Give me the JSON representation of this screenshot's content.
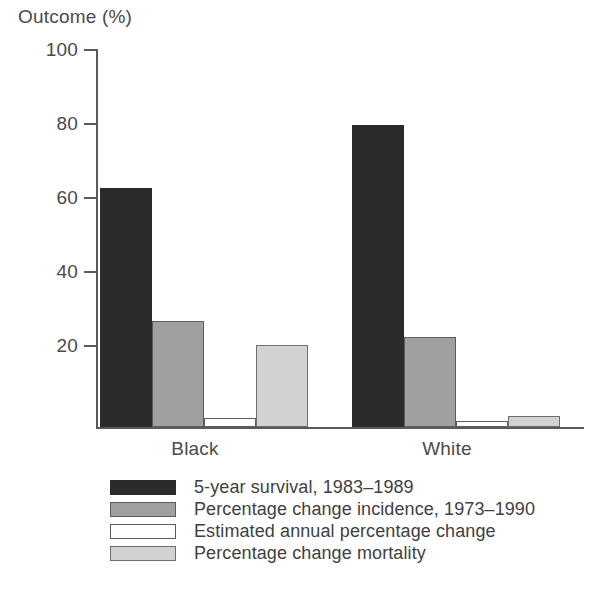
{
  "chart_data": {
    "type": "bar",
    "title": "",
    "xlabel": "",
    "ylabel": "Outcome (%)",
    "ylim": [
      0,
      100
    ],
    "yticks": [
      0,
      20,
      40,
      60,
      80,
      100
    ],
    "ytick_labels": [
      "",
      "20",
      "40",
      "60",
      "80",
      "100"
    ],
    "grid": false,
    "legend_position": "bottom-left",
    "categories": [
      "Black",
      "White"
    ],
    "series": [
      {
        "name": "5-year survival, 1983–1989",
        "color": "#2b2b2b",
        "values": [
          63.5,
          80.0
        ]
      },
      {
        "name": "Percentage change incidence, 1973–1990",
        "color": "#a0a0a0",
        "values": [
          28.0,
          23.8
        ]
      },
      {
        "name": "Estimated annual percentage change",
        "color": "#ffffff",
        "values": [
          2.5,
          1.5
        ]
      },
      {
        "name": "Percentage change mortality",
        "color": "#d2d2d2",
        "values": [
          21.8,
          3.0
        ]
      }
    ]
  },
  "axis": {
    "y_title": "Outcome (%)",
    "tick_100": "100",
    "tick_80": "80",
    "tick_60": "60",
    "tick_40": "40",
    "tick_20": "20"
  },
  "categories": {
    "black": "Black",
    "white": "White"
  },
  "legend": {
    "item_0": "5-year survival, 1983–1989",
    "item_1": "Percentage change incidence, 1973–1990",
    "item_2": "Estimated annual percentage change",
    "item_3": "Percentage change mortality"
  },
  "colors": {
    "series_0": "#2b2b2b",
    "series_1": "#a0a0a0",
    "series_2": "#ffffff",
    "series_3": "#d2d2d2",
    "axis": "#5a5a5a",
    "text": "#4a4a4a",
    "background": "#ffffff"
  }
}
